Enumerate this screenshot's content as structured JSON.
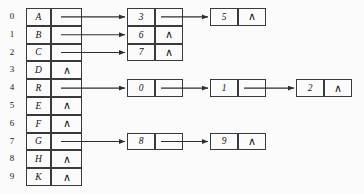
{
  "diagram": {
    "null_symbol": "∧",
    "line_color": "#3a3a3a",
    "background": "#fbfbfb",
    "table": {
      "name": "hash-table",
      "indices": [
        "0",
        "1",
        "2",
        "3",
        "4",
        "5",
        "6",
        "7",
        "8",
        "9"
      ],
      "rows": [
        {
          "index": "0",
          "key": "A",
          "pointer": "link",
          "null": ""
        },
        {
          "index": "1",
          "key": "B",
          "pointer": "link",
          "null": ""
        },
        {
          "index": "2",
          "key": "C",
          "pointer": "link",
          "null": ""
        },
        {
          "index": "3",
          "key": "D",
          "pointer": "null",
          "null": "∧"
        },
        {
          "index": "4",
          "key": "R",
          "pointer": "link",
          "null": ""
        },
        {
          "index": "5",
          "key": "E",
          "pointer": "null",
          "null": "∧"
        },
        {
          "index": "6",
          "key": "F",
          "pointer": "null",
          "null": "∧"
        },
        {
          "index": "7",
          "key": "G",
          "pointer": "link",
          "null": ""
        },
        {
          "index": "8",
          "key": "H",
          "pointer": "null",
          "null": "∧"
        },
        {
          "index": "9",
          "key": "K",
          "pointer": "null",
          "null": "∧"
        }
      ]
    },
    "chains": [
      {
        "from_index": "0",
        "nodes": [
          {
            "value": "3",
            "pointer": "link",
            "null": ""
          },
          {
            "value": "5",
            "pointer": "null",
            "null": "∧"
          }
        ]
      },
      {
        "from_index": "1",
        "nodes": [
          {
            "value": "6",
            "pointer": "null",
            "null": "∧"
          }
        ]
      },
      {
        "from_index": "2",
        "nodes": [
          {
            "value": "7",
            "pointer": "null",
            "null": "∧"
          }
        ]
      },
      {
        "from_index": "4",
        "nodes": [
          {
            "value": "0",
            "pointer": "link",
            "null": ""
          },
          {
            "value": "1",
            "pointer": "link",
            "null": ""
          },
          {
            "value": "2",
            "pointer": "null",
            "null": "∧"
          }
        ]
      },
      {
        "from_index": "7",
        "nodes": [
          {
            "value": "8",
            "pointer": "link",
            "null": ""
          },
          {
            "value": "9",
            "pointer": "null",
            "null": "∧"
          }
        ]
      }
    ]
  }
}
